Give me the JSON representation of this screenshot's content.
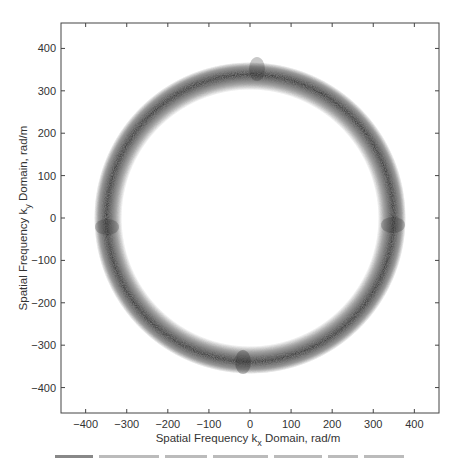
{
  "chart_data": {
    "type": "scatter",
    "title": "",
    "xlabel": "Spatial Frequency k_x Domain, rad/m",
    "ylabel": "Spatial Frequency k_y Domain, rad/m",
    "xlim": [
      -460,
      460
    ],
    "ylim": [
      -460,
      460
    ],
    "x_ticks": [
      -400,
      -300,
      -200,
      -100,
      0,
      100,
      200,
      300,
      400
    ],
    "y_ticks": [
      -400,
      -300,
      -200,
      -100,
      0,
      100,
      200,
      300,
      400
    ],
    "grid": false,
    "legend": null,
    "ring": {
      "center": [
        0,
        0
      ],
      "inner_radius": 320,
      "outer_radius": 370,
      "denser_regions_at_angles_deg": [
        0,
        90,
        180,
        270
      ]
    },
    "point_color": "#555555"
  },
  "axes": {
    "xlabel_main": "Spatial Frequency k",
    "xlabel_sub": "x",
    "xlabel_tail": " Domain, rad/m",
    "ylabel_main": "Spatial Frequency k",
    "ylabel_sub": "y",
    "ylabel_tail": " Domain, rad/m",
    "x_tick_labels": [
      "−400",
      "−300",
      "−200",
      "−100",
      "0",
      "100",
      "200",
      "300",
      "400"
    ],
    "y_tick_labels": [
      "400",
      "300",
      "200",
      "100",
      "0",
      "−100",
      "−200",
      "−300",
      "−400"
    ]
  }
}
